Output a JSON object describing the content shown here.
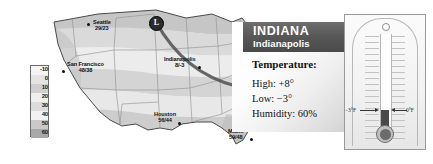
{
  "legend": {
    "name": "temperature-scale",
    "labels": [
      "-10",
      "0",
      "10",
      "20",
      "30",
      "40",
      "50",
      "60"
    ],
    "colors": [
      "#f4f4f4",
      "#e4e4e4",
      "#cfcfcf",
      "#efefef",
      "#dcdcdc",
      "#f2f2f2",
      "#c9c9c9",
      "#a8a8a8"
    ]
  },
  "map": {
    "name": "usa-weather-map",
    "low_pressure_marker": "L",
    "cities": [
      {
        "name": "Seattle",
        "temps": "29/23",
        "x": 57,
        "y": 17,
        "dotx": 51,
        "doty": 19
      },
      {
        "name": "San Francisco",
        "temps": "48/38",
        "x": 32,
        "y": 59,
        "dotx": 26,
        "doty": 66
      },
      {
        "name": "Indianapolis",
        "temps": "8/-3",
        "x": 140,
        "y": 53,
        "dotx": 162,
        "doty": 62
      },
      {
        "name": "Boston",
        "temps": "17/6",
        "x": 208,
        "y": 34,
        "dotx": 228,
        "doty": 36
      },
      {
        "name": "Houston",
        "temps": "56/44",
        "x": 122,
        "y": 110,
        "dotx": 142,
        "doty": 118
      },
      {
        "name": "Miami",
        "temps": "59/48",
        "x": 196,
        "y": 127,
        "dotx": 214,
        "doty": 134
      }
    ]
  },
  "panel": {
    "state": "INDIANA",
    "city": "Indianapolis",
    "temperature_heading": "Temperature:",
    "high": "High: +8°",
    "low": "Low: −3°",
    "humidity": "Humidity: 60%"
  },
  "thermometer": {
    "name": "wall-thermometer",
    "left_label": "−3°F",
    "right_label": "0°F"
  },
  "colors": {
    "banner_bg": "#585858",
    "banner_text": "#ffffff",
    "mercury": "#4a4a4a",
    "text": "#111111"
  }
}
